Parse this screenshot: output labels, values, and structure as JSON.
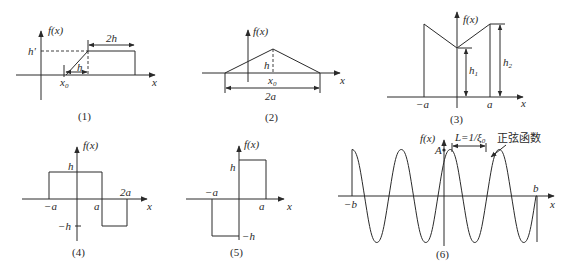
{
  "figure": {
    "panels": [
      {
        "id": "1",
        "caption": "(1)",
        "y_axis_label": "f(x)",
        "x_axis_label": "x",
        "labels": {
          "height": "h'",
          "ramp_width": "h",
          "flat_width": "2h",
          "start": "x0"
        }
      },
      {
        "id": "2",
        "caption": "(2)",
        "y_axis_label": "f(x)",
        "x_axis_label": "x",
        "labels": {
          "height": "h",
          "center": "x0",
          "base_width": "2a"
        }
      },
      {
        "id": "3",
        "caption": "(3)",
        "y_axis_label": "f(x)",
        "x_axis_label": "x",
        "labels": {
          "left": "−a",
          "right": "a",
          "inner_height": "h1",
          "outer_height": "h2"
        }
      },
      {
        "id": "4",
        "caption": "(4)",
        "y_axis_label": "f(x)",
        "x_axis_label": "x",
        "labels": {
          "pos_height": "h",
          "neg_height": "−h",
          "left": "−a",
          "mid": "a",
          "right": "2a"
        }
      },
      {
        "id": "5",
        "caption": "(5)",
        "y_axis_label": "f(x)",
        "x_axis_label": "x",
        "labels": {
          "pos_height": "h",
          "neg_height": "−h",
          "left": "−a",
          "right": "a"
        }
      },
      {
        "id": "6",
        "caption": "(6)",
        "y_axis_label": "f(x)",
        "x_axis_label": "x",
        "labels": {
          "amplitude": "A",
          "period": "L=1/ξ0",
          "left": "−b",
          "right": "b",
          "annotation": "正弦函数"
        }
      }
    ]
  }
}
